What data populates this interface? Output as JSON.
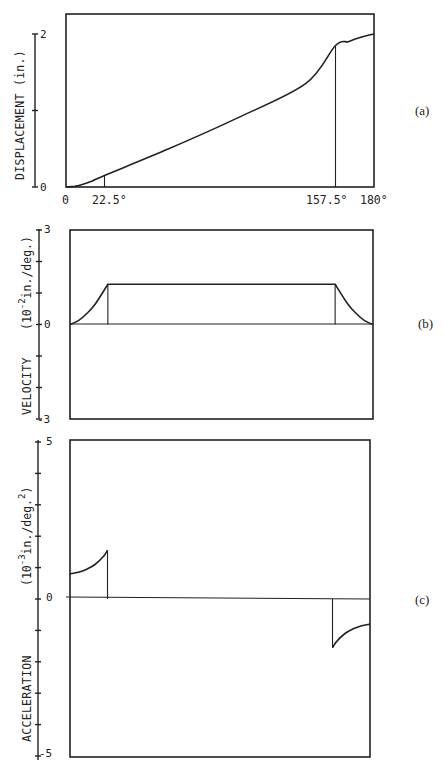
{
  "chart_data": [
    {
      "id": "a",
      "type": "line",
      "panel_label": "(a)",
      "title": "",
      "ylabel": "DISPLACEMENT (in.)",
      "xlabel": "",
      "x_unit": "deg",
      "xlim": [
        0,
        180
      ],
      "ylim": [
        0,
        2
      ],
      "y_ticks": [
        0,
        1,
        2
      ],
      "y_tick_labels": [
        "0",
        "",
        "2"
      ],
      "x_tick_labels": [
        "0",
        "22.5°",
        "157.5°",
        "180°"
      ],
      "x_ticks": [
        0,
        22.5,
        157.5,
        180
      ],
      "grid": false,
      "series": [
        {
          "name": "displacement",
          "x": [
            0,
            5,
            10,
            15,
            22.5,
            60,
            100,
            140,
            157.5,
            165,
            170,
            175,
            180
          ],
          "y": [
            0,
            0.008,
            0.035,
            0.075,
            0.15,
            0.5,
            0.9,
            1.35,
            1.85,
            1.9,
            1.94,
            1.975,
            2.0
          ]
        }
      ],
      "markers": [
        {
          "x": 22.5,
          "label": "22.5°"
        },
        {
          "x": 157.5,
          "label": "157.5°"
        }
      ]
    },
    {
      "id": "b",
      "type": "line",
      "panel_label": "(b)",
      "ylabel": "VELOCITY (10^-2 in./deg.)",
      "ylabel_parts": {
        "name": "VELOCITY",
        "unit_prefix": "(10",
        "unit_exp": "-2",
        "unit_suffix": "in./deg.)"
      },
      "xlim": [
        0,
        180
      ],
      "ylim": [
        -3,
        3
      ],
      "y_ticks": [
        -3,
        -2,
        -1,
        0,
        1,
        2,
        3
      ],
      "y_tick_labels": [
        "-3",
        "",
        "",
        "0",
        "",
        "",
        "3"
      ],
      "grid": false,
      "series": [
        {
          "name": "velocity",
          "x": [
            0,
            5,
            10,
            15,
            22.5,
            157.5,
            165,
            170,
            175,
            180
          ],
          "y": [
            0,
            0.12,
            0.35,
            0.65,
            1.28,
            1.28,
            0.65,
            0.35,
            0.12,
            0
          ]
        }
      ],
      "markers": [
        {
          "x": 22.5
        },
        {
          "x": 157.5
        }
      ]
    },
    {
      "id": "c",
      "type": "line",
      "panel_label": "(c)",
      "ylabel": "ACCELERATION (10^-3 in./deg.^2)",
      "ylabel_parts": {
        "name": "ACCELERATION",
        "unit_prefix": "(10",
        "unit_exp": "-3",
        "unit_mid": "in./deg.",
        "unit_exp2": "2",
        "unit_suffix": ")"
      },
      "xlim": [
        0,
        180
      ],
      "ylim": [
        -5,
        5
      ],
      "y_ticks": [
        -5,
        -4,
        -3,
        -2,
        -1,
        0,
        1,
        2,
        3,
        4,
        5
      ],
      "y_tick_labels": [
        "-5",
        "",
        "",
        "",
        "",
        "0",
        "",
        "",
        "",
        "",
        "5"
      ],
      "grid": false,
      "series": [
        {
          "name": "acceleration-rise",
          "x": [
            0,
            5,
            10,
            15,
            20,
            22.5
          ],
          "y": [
            0.8,
            0.85,
            0.95,
            1.1,
            1.35,
            1.55
          ]
        },
        {
          "name": "acceleration-fall",
          "x": [
            157.5,
            160,
            165,
            170,
            175,
            180
          ],
          "y": [
            -1.55,
            -1.35,
            -1.1,
            -0.95,
            -0.85,
            -0.8
          ]
        }
      ],
      "markers": [
        {
          "x": 22.5
        },
        {
          "x": 157.5
        }
      ]
    }
  ]
}
